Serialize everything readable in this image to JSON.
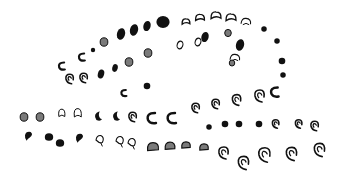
{
  "image": {
    "width": 346,
    "height": 187,
    "background": "#ffffff",
    "ink": "#111111",
    "fill_gray": "#7a7a7a",
    "description": "Hand-drawn glyph shapes arranged along curved paths"
  },
  "glyphs": [
    {
      "x": 62,
      "y": 66,
      "t": "curl",
      "s": 7
    },
    {
      "x": 70,
      "y": 79,
      "t": "swirl",
      "s": 8
    },
    {
      "x": 84,
      "y": 78,
      "t": "swirl",
      "s": 8
    },
    {
      "x": 82,
      "y": 57,
      "t": "curl",
      "s": 7
    },
    {
      "x": 93,
      "y": 50,
      "t": "dot",
      "s": 4
    },
    {
      "x": 104,
      "y": 42,
      "t": "stipple",
      "s": 7
    },
    {
      "x": 121,
      "y": 34,
      "t": "oval",
      "s": 9
    },
    {
      "x": 134,
      "y": 30,
      "t": "oval",
      "s": 9
    },
    {
      "x": 147,
      "y": 26,
      "t": "oval",
      "s": 8
    },
    {
      "x": 163,
      "y": 22,
      "t": "blob",
      "s": 11
    },
    {
      "x": 180,
      "y": 45,
      "t": "ring",
      "s": 7
    },
    {
      "x": 186,
      "y": 22,
      "t": "cap",
      "s": 7
    },
    {
      "x": 200,
      "y": 18,
      "t": "cap",
      "s": 8
    },
    {
      "x": 216,
      "y": 16,
      "t": "cap",
      "s": 9
    },
    {
      "x": 231,
      "y": 18,
      "t": "cap",
      "s": 9
    },
    {
      "x": 246,
      "y": 22,
      "t": "capopen",
      "s": 9
    },
    {
      "x": 264,
      "y": 29,
      "t": "dot",
      "s": 5
    },
    {
      "x": 277,
      "y": 41,
      "t": "dot",
      "s": 5
    },
    {
      "x": 282,
      "y": 61,
      "t": "dot",
      "s": 6
    },
    {
      "x": 283,
      "y": 75,
      "t": "dot",
      "s": 5
    },
    {
      "x": 198,
      "y": 42,
      "t": "ring",
      "s": 7
    },
    {
      "x": 205,
      "y": 37,
      "t": "oval",
      "s": 8
    },
    {
      "x": 228,
      "y": 33,
      "t": "stipple",
      "s": 6
    },
    {
      "x": 240,
      "y": 45,
      "t": "oval",
      "s": 9
    },
    {
      "x": 235,
      "y": 58,
      "t": "capopen",
      "s": 9
    },
    {
      "x": 232,
      "y": 63,
      "t": "stipple",
      "s": 5
    },
    {
      "x": 101,
      "y": 74,
      "t": "oval",
      "s": 7
    },
    {
      "x": 115,
      "y": 68,
      "t": "oval",
      "s": 6
    },
    {
      "x": 129,
      "y": 62,
      "t": "stipple",
      "s": 7
    },
    {
      "x": 148,
      "y": 53,
      "t": "stipple",
      "s": 7
    },
    {
      "x": 147,
      "y": 86,
      "t": "dot",
      "s": 6
    },
    {
      "x": 124,
      "y": 93,
      "t": "curl",
      "s": 6
    },
    {
      "x": 24,
      "y": 117,
      "t": "stipple",
      "s": 7
    },
    {
      "x": 40,
      "y": 117,
      "t": "stipple",
      "s": 7
    },
    {
      "x": 62,
      "y": 113,
      "t": "lobe",
      "s": 7
    },
    {
      "x": 78,
      "y": 113,
      "t": "lobe",
      "s": 8
    },
    {
      "x": 98,
      "y": 116,
      "t": "crescent",
      "s": 8
    },
    {
      "x": 116,
      "y": 116,
      "t": "crescent",
      "s": 8
    },
    {
      "x": 133,
      "y": 117,
      "t": "swirl",
      "s": 8
    },
    {
      "x": 152,
      "y": 118,
      "t": "hook",
      "s": 10
    },
    {
      "x": 172,
      "y": 118,
      "t": "hook",
      "s": 10
    },
    {
      "x": 196,
      "y": 108,
      "t": "swirl",
      "s": 8
    },
    {
      "x": 216,
      "y": 104,
      "t": "swirl",
      "s": 8
    },
    {
      "x": 237,
      "y": 100,
      "t": "swirl",
      "s": 9
    },
    {
      "x": 260,
      "y": 96,
      "t": "swirl",
      "s": 10
    },
    {
      "x": 275,
      "y": 92,
      "t": "hook",
      "s": 9
    },
    {
      "x": 209,
      "y": 127,
      "t": "dot",
      "s": 5
    },
    {
      "x": 225,
      "y": 124,
      "t": "dot",
      "s": 6
    },
    {
      "x": 239,
      "y": 124,
      "t": "dot",
      "s": 6
    },
    {
      "x": 259,
      "y": 124,
      "t": "dot",
      "s": 6
    },
    {
      "x": 276,
      "y": 124,
      "t": "swirl",
      "s": 7
    },
    {
      "x": 299,
      "y": 124,
      "t": "swirl",
      "s": 7
    },
    {
      "x": 315,
      "y": 126,
      "t": "swirl",
      "s": 8
    },
    {
      "x": 29,
      "y": 136,
      "t": "comma",
      "s": 8
    },
    {
      "x": 49,
      "y": 137,
      "t": "blob",
      "s": 7
    },
    {
      "x": 60,
      "y": 143,
      "t": "blob",
      "s": 7
    },
    {
      "x": 80,
      "y": 138,
      "t": "comma",
      "s": 8
    },
    {
      "x": 100,
      "y": 140,
      "t": "leaf",
      "s": 8
    },
    {
      "x": 120,
      "y": 141,
      "t": "leaf",
      "s": 8
    },
    {
      "x": 132,
      "y": 143,
      "t": "leaf",
      "s": 8
    },
    {
      "x": 153,
      "y": 148,
      "t": "brain",
      "s": 9
    },
    {
      "x": 170,
      "y": 147,
      "t": "brain",
      "s": 8
    },
    {
      "x": 186,
      "y": 146,
      "t": "brain",
      "s": 7
    },
    {
      "x": 204,
      "y": 148,
      "t": "brain",
      "s": 7
    },
    {
      "x": 224,
      "y": 153,
      "t": "swirl",
      "s": 10
    },
    {
      "x": 244,
      "y": 163,
      "t": "swirl",
      "s": 11
    },
    {
      "x": 265,
      "y": 155,
      "t": "swirl",
      "s": 12
    },
    {
      "x": 292,
      "y": 154,
      "t": "swirl",
      "s": 11
    },
    {
      "x": 320,
      "y": 150,
      "t": "swirl",
      "s": 11
    }
  ]
}
